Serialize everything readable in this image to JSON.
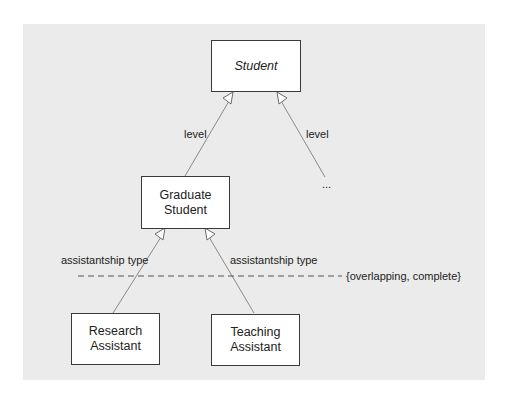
{
  "diagram": {
    "type": "UML generalization hierarchy",
    "classes": {
      "student": {
        "label": "Student",
        "abstract": true
      },
      "graduate_student": {
        "label": "Graduate Student",
        "line1": "Graduate",
        "line2": "Student"
      },
      "research_assistant": {
        "label": "Research Assistant",
        "line1": "Research",
        "line2": "Assistant"
      },
      "teaching_assistant": {
        "label": "Teaching Assistant",
        "line1": "Teaching",
        "line2": "Assistant"
      }
    },
    "generalizations": [
      {
        "from": "Graduate Student",
        "to": "Student",
        "discriminator": "level"
      },
      {
        "from": "...",
        "to": "Student",
        "discriminator": "level"
      },
      {
        "from": "Research Assistant",
        "to": "Graduate Student",
        "discriminator": "assistantship type"
      },
      {
        "from": "Teaching Assistant",
        "to": "Graduate Student",
        "discriminator": "assistantship type"
      }
    ],
    "labels": {
      "level_left": "level",
      "level_right": "level",
      "ellipsis": "...",
      "assistantship_left": "assistantship type",
      "assistantship_right": "assistantship type",
      "constraint": "{overlapping, complete}"
    },
    "colors": {
      "background": "#ebebeb",
      "box_fill": "#ffffff",
      "box_border": "#3a3a3a",
      "line": "#8a8a8a"
    }
  }
}
